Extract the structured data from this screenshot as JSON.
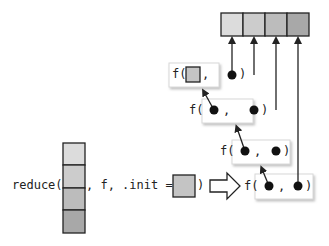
{
  "diagram": {
    "type": "reduce-with-init",
    "top_array": {
      "cells": 4,
      "colors": [
        "#dcdcdc",
        "#cccccc",
        "#bcbcbc",
        "#a8a8a8"
      ]
    },
    "input_array": {
      "cells": 4,
      "colors": [
        "#dcdcdc",
        "#cccccc",
        "#bcbcbc",
        "#a8a8a8"
      ]
    },
    "init_color": "#c4c4c4",
    "call": {
      "fn": "reduce(",
      "args": ", f, .init = ",
      "close": ")"
    },
    "f_calls": [
      {
        "label": "f(",
        "sep": ",",
        "close": ")",
        "first": "init-square",
        "second": "dot"
      },
      {
        "label": "f(",
        "sep": ",",
        "close": ")",
        "first": "dot",
        "second": "dot"
      },
      {
        "label": "f(",
        "sep": ",",
        "close": ")",
        "first": "dot",
        "second": "dot"
      },
      {
        "label": "f(",
        "sep": ",",
        "close": ")",
        "first": "dot",
        "second": "dot"
      }
    ],
    "colors": {
      "stroke": "#222222",
      "box_border": "#d8d8d8",
      "box_shadow": "#bbbbbb"
    }
  }
}
